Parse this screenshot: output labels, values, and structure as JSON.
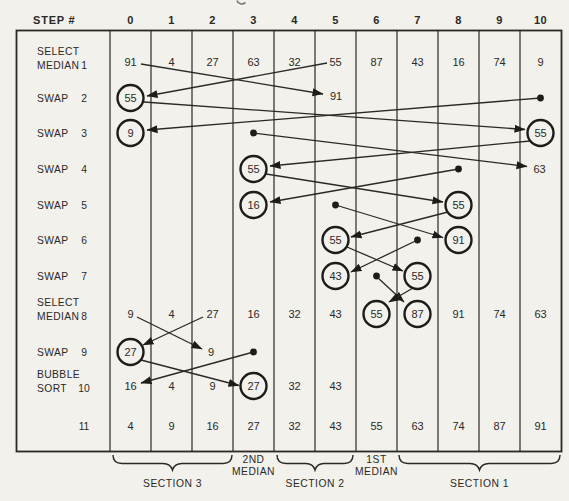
{
  "header": {
    "step_label": "STEP #",
    "columns": [
      "0",
      "1",
      "2",
      "3",
      "4",
      "5",
      "6",
      "7",
      "8",
      "9",
      "10"
    ]
  },
  "row_labels": {
    "r1": {
      "line1": "SELECT",
      "line2": "MEDIAN",
      "step": "1"
    },
    "r2": {
      "line1": "SWAP",
      "step": "2"
    },
    "r3": {
      "line1": "SWAP",
      "step": "3"
    },
    "r4": {
      "line1": "SWAP",
      "step": "4"
    },
    "r5": {
      "line1": "SWAP",
      "step": "5"
    },
    "r6": {
      "line1": "SWAP",
      "step": "6"
    },
    "r7": {
      "line1": "SWAP",
      "step": "7"
    },
    "r8": {
      "line1": "SELECT",
      "line2": "MEDIAN",
      "step": "8"
    },
    "r9": {
      "line1": "SWAP",
      "step": "9"
    },
    "r10": {
      "line1": "BUBBLE",
      "line2": "SORT",
      "step": "10"
    },
    "r11": {
      "step": "11"
    }
  },
  "values": {
    "r1": {
      "c0": "91",
      "c1": "4",
      "c2": "27",
      "c3": "63",
      "c4": "32",
      "c5": "55",
      "c6": "87",
      "c7": "43",
      "c8": "16",
      "c9": "74",
      "c10": "9"
    },
    "r2": {
      "c0": "55",
      "c5": "91"
    },
    "r3": {
      "c0": "9",
      "c10": "55"
    },
    "r4": {
      "c3": "55",
      "c10": "63"
    },
    "r5": {
      "c3": "16",
      "c8": "55"
    },
    "r6": {
      "c5": "55",
      "c8": "91"
    },
    "r7": {
      "c5": "43",
      "c7": "55"
    },
    "r8": {
      "c0": "9",
      "c1": "4",
      "c2": "27",
      "c3": "16",
      "c4": "32",
      "c5": "43",
      "c6": "55",
      "c7": "87",
      "c8": "91",
      "c9": "74",
      "c10": "63"
    },
    "r9": {
      "c0": "27",
      "c2": "9"
    },
    "r10": {
      "c0": "16",
      "c1": "4",
      "c2": "9",
      "c3": "27",
      "c4": "32",
      "c5": "43"
    },
    "r11": {
      "c0": "4",
      "c1": "9",
      "c2": "16",
      "c3": "27",
      "c4": "32",
      "c5": "43",
      "c6": "55",
      "c7": "63",
      "c8": "74",
      "c9": "87",
      "c10": "91"
    }
  },
  "footer": {
    "section3": "SECTION 3",
    "median2_line1": "2ND",
    "median2_line2": "MEDIAN",
    "section2": "SECTION 2",
    "median1_line1": "1ST",
    "median1_line2": "MEDIAN",
    "section1": "SECTION 1"
  },
  "colors": {
    "ink": "#2a2927",
    "paper": "#f3f1ec"
  }
}
